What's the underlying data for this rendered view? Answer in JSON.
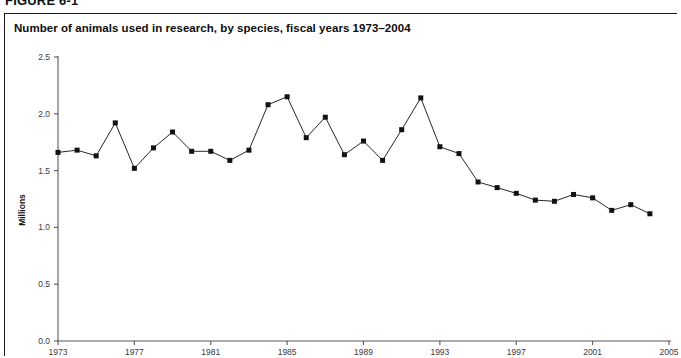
{
  "figure": {
    "label": "FIGURE 6-1"
  },
  "chart_title": "Number of animals used in research, by species, fiscal years 1973–2004",
  "axis": {
    "y_title": "Millions",
    "y_ticks": [
      "0.0",
      "0.5",
      "1.0",
      "1.5",
      "2.0",
      "2.5"
    ],
    "x_ticks": [
      "1973",
      "1977",
      "1981",
      "1985",
      "1989",
      "1993",
      "1997",
      "2001",
      "2005"
    ]
  },
  "colors": {
    "line": "#1b1b1b",
    "marker": "#121212",
    "axis": "#585858",
    "border": "#1a1a1a",
    "background": "#ffffff"
  },
  "chart_data": {
    "type": "line",
    "title": "Number of animals used in research, by species, fiscal years 1973–2004",
    "xlabel": "",
    "ylabel": "Millions",
    "xlim": [
      1973,
      2005
    ],
    "ylim": [
      0.0,
      2.5
    ],
    "ytick_step": 0.5,
    "xtick_step": 4,
    "grid": false,
    "legend": false,
    "marker": "square",
    "x": [
      1973,
      1974,
      1975,
      1976,
      1977,
      1978,
      1979,
      1980,
      1981,
      1982,
      1983,
      1984,
      1985,
      1986,
      1987,
      1988,
      1989,
      1990,
      1991,
      1992,
      1993,
      1994,
      1995,
      1996,
      1997,
      1998,
      1999,
      2000,
      2001,
      2002,
      2003,
      2004
    ],
    "values": [
      1.66,
      1.68,
      1.63,
      1.92,
      1.52,
      1.7,
      1.84,
      1.67,
      1.67,
      1.59,
      1.68,
      2.08,
      2.15,
      1.79,
      1.97,
      1.64,
      1.76,
      1.59,
      1.86,
      2.14,
      1.71,
      1.65,
      1.4,
      1.35,
      1.3,
      1.24,
      1.23,
      1.29,
      1.26,
      1.15,
      1.2,
      1.12
    ],
    "series": [
      {
        "name": "Animals used in research",
        "values": [
          1.66,
          1.68,
          1.63,
          1.92,
          1.52,
          1.7,
          1.84,
          1.67,
          1.67,
          1.59,
          1.68,
          2.08,
          2.15,
          1.79,
          1.97,
          1.64,
          1.76,
          1.59,
          1.86,
          2.14,
          1.71,
          1.65,
          1.4,
          1.35,
          1.3,
          1.24,
          1.23,
          1.29,
          1.26,
          1.15,
          1.2,
          1.12
        ]
      }
    ]
  }
}
